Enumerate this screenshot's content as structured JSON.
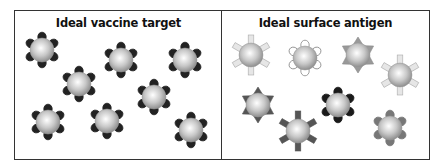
{
  "figure": {
    "panels": [
      {
        "id": "left",
        "title": "Ideal vaccine target",
        "particles": [
          {
            "x": 42,
            "y": 50,
            "spike": "round",
            "fill": "#222222",
            "stroke": "#222222"
          },
          {
            "x": 79,
            "y": 84,
            "spike": "round",
            "fill": "#222222",
            "stroke": "#222222"
          },
          {
            "x": 121,
            "y": 60,
            "spike": "round",
            "fill": "#222222",
            "stroke": "#222222"
          },
          {
            "x": 185,
            "y": 60,
            "spike": "round",
            "fill": "#222222",
            "stroke": "#222222"
          },
          {
            "x": 154,
            "y": 97,
            "spike": "round",
            "fill": "#222222",
            "stroke": "#222222"
          },
          {
            "x": 48,
            "y": 122,
            "spike": "round",
            "fill": "#222222",
            "stroke": "#222222"
          },
          {
            "x": 107,
            "y": 121,
            "spike": "round",
            "fill": "#222222",
            "stroke": "#222222"
          },
          {
            "x": 191,
            "y": 130,
            "spike": "round",
            "fill": "#222222",
            "stroke": "#222222"
          }
        ]
      },
      {
        "id": "right",
        "title": "Ideal surface antigen",
        "particles": [
          {
            "x": 251,
            "y": 55,
            "spike": "rect",
            "fill": "#e6e6e6",
            "stroke": "#aaaaaa"
          },
          {
            "x": 305,
            "y": 58,
            "spike": "round",
            "fill": "#ffffff",
            "stroke": "#888888"
          },
          {
            "x": 358,
            "y": 55,
            "spike": "tri",
            "fill": "#999999",
            "stroke": "#888888"
          },
          {
            "x": 400,
            "y": 75,
            "spike": "rect",
            "fill": "#e6e6e6",
            "stroke": "#aaaaaa"
          },
          {
            "x": 258,
            "y": 105,
            "spike": "tri",
            "fill": "#555555",
            "stroke": "#555555"
          },
          {
            "x": 298,
            "y": 131,
            "spike": "rect",
            "fill": "#555555",
            "stroke": "#555555"
          },
          {
            "x": 338,
            "y": 105,
            "spike": "round",
            "fill": "#1a1a1a",
            "stroke": "#1a1a1a"
          },
          {
            "x": 390,
            "y": 128,
            "spike": "round",
            "fill": "#777777",
            "stroke": "#777777"
          }
        ]
      }
    ],
    "colors": {
      "border": "#333333",
      "sphere_highlight": "#ffffff",
      "sphere_shadow": "#8a8a8a"
    }
  }
}
